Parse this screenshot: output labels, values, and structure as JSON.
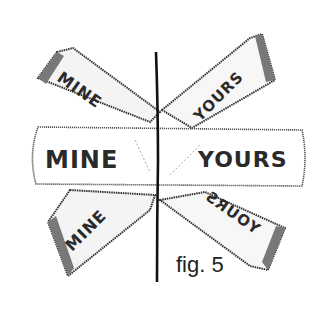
{
  "figure": {
    "caption": "fig. 5",
    "style": "hand-drawn pencil sketch, black on white",
    "divider": "vertical line separating left and right halves"
  },
  "signs": {
    "center_left": {
      "label": "MINE"
    },
    "center_right": {
      "label": "YOURS"
    },
    "upper_left": {
      "label": "MINE"
    },
    "upper_right": {
      "label": "YOURS"
    },
    "lower_left": {
      "label": "MINE"
    },
    "lower_right": {
      "label": "YOURS"
    }
  },
  "colors": {
    "ink": "#222222",
    "shade": "#555555",
    "paper": "#ffffff"
  }
}
